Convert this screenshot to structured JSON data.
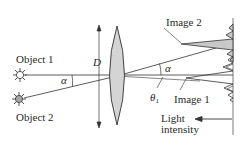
{
  "diagram": {
    "type": "optics-resolution",
    "labels": {
      "object1": "Object 1",
      "object2": "Object 2",
      "aperture": "D",
      "angle_left": "α",
      "angle_right": "α",
      "theta": "θ",
      "theta_sub": "1",
      "image2": "Image 2",
      "image1": "Image 1",
      "intensity_line1": "Light",
      "intensity_line2": "intensity"
    },
    "colors": {
      "line": "#333333",
      "lens_fill": "#d4d4d4",
      "image2_fill": "#c8c8c8",
      "object2_fill": "#a8a8a8",
      "background": "#ffffff"
    }
  }
}
